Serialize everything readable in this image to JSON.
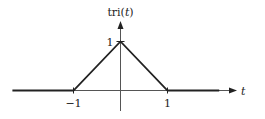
{
  "chart_data": {
    "type": "line",
    "title": "",
    "ylabel": "tri(t)",
    "ylabel_parts": {
      "fn": "tri(",
      "var": "t",
      "close": ")"
    },
    "xlabel": "t",
    "xlim": [
      -2.3,
      2.3
    ],
    "ylim": [
      0,
      1.25
    ],
    "grid": false,
    "x_ticks": [
      -1,
      1
    ],
    "x_tick_labels": [
      "−1",
      "1"
    ],
    "y_ticks": [
      1
    ],
    "y_tick_labels": [
      "1"
    ],
    "series": [
      {
        "name": "tri(t)",
        "x": [
          -2.3,
          -1,
          0,
          1,
          2.1
        ],
        "y": [
          0,
          0,
          1,
          0,
          0
        ]
      }
    ],
    "colors": {
      "line": "#222222",
      "axis": "#555555"
    }
  }
}
